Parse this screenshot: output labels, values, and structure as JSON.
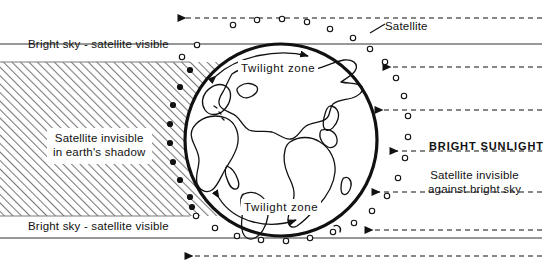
{
  "figure": {
    "type": "diagram",
    "background_color": "#ffffff",
    "ink_color": "#111111",
    "shadow_hatch_color": "#777777"
  },
  "labels": {
    "bright_sky_top": "Bright sky - satellite visible",
    "bright_sky_bottom": "Bright sky - satellite visible",
    "shadow_line1": "Satellite invisible",
    "shadow_line2": "in earth's shadow",
    "twilight_top": "Twilight zone",
    "twilight_bottom": "Twilight zone",
    "satellite": "Satellite",
    "bright_sunlight": "BRIGHT SUNLIGHT",
    "against_line1": "Satellite invisible",
    "against_line2": "against bright sky"
  },
  "earth": {
    "center_x": 281,
    "center_y": 140,
    "radius": 96,
    "outline_width": 3
  },
  "shadow_region": {
    "top_y": 62,
    "bottom_y": 216,
    "left_x": 0,
    "hatch_angle_deg": 45
  },
  "sunlight_rays": {
    "direction": "right-to-left",
    "style": "dashed",
    "count": 6,
    "y_positions": [
      18,
      67,
      110,
      151,
      192,
      256
    ]
  },
  "visibility_bands": {
    "top_solid_line_y": 44,
    "bottom_solid_line_y": 238
  },
  "satellites": {
    "visible_marker": "open-circle",
    "shadowed_marker": "filled-circle",
    "visible_count": 22,
    "shadowed_count": 8
  }
}
